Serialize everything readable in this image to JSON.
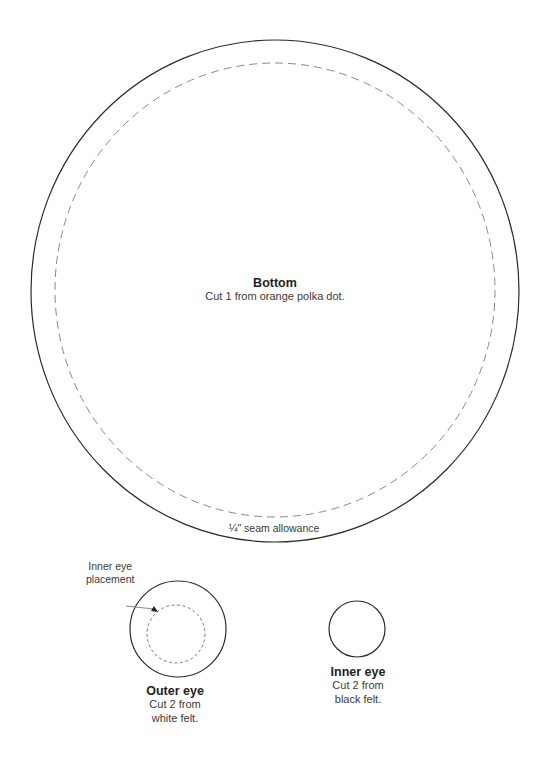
{
  "pieces": {
    "bottom": {
      "title": "Bottom",
      "instruction": "Cut 1 from orange polka dot.",
      "seam_label": "¼\" seam allowance"
    },
    "outer_eye": {
      "title": "Outer eye",
      "instruction_line1": "Cut 2 from",
      "instruction_line2": "white felt.",
      "callout_line1": "Inner eye",
      "callout_line2": "placement"
    },
    "inner_eye": {
      "title": "Inner eye",
      "instruction_line1": "Cut 2 from",
      "instruction_line2": "black felt."
    }
  },
  "colors": {
    "cut_line": "#2b2b2b",
    "stitch_line": "#8a8a8a"
  }
}
